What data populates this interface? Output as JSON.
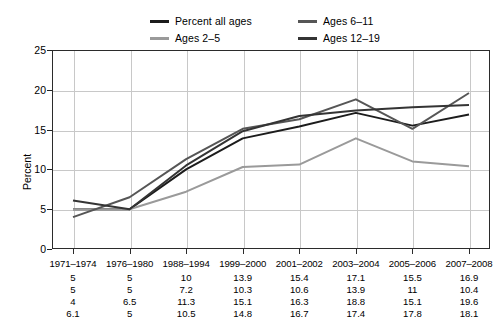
{
  "chart_data": {
    "type": "line",
    "title": "",
    "xlabel": "",
    "ylabel": "Percent",
    "ylim": [
      0,
      25
    ],
    "yticks": [
      0,
      5,
      10,
      15,
      20,
      25
    ],
    "grid": true,
    "legend_position": "top",
    "categories": [
      "1971–1974",
      "1976–1980",
      "1988–1994",
      "1999–2000",
      "2001–2002",
      "2003–2004",
      "2005–2006",
      "2007–2008"
    ],
    "series": [
      {
        "name": "Percent all ages",
        "color": "#1c1c1c",
        "values": [
          5,
          5,
          10,
          13.9,
          15.4,
          17.1,
          15.5,
          16.9
        ]
      },
      {
        "name": "Ages 2–5",
        "color": "#9a9a9a",
        "values": [
          5,
          5,
          7.2,
          10.3,
          10.6,
          13.9,
          11,
          10.4
        ]
      },
      {
        "name": "Ages 6–11",
        "color": "#565656",
        "values": [
          4,
          6.5,
          11.3,
          15.1,
          16.3,
          18.8,
          15.1,
          19.6
        ]
      },
      {
        "name": "Ages 12–19",
        "color": "#343434",
        "values": [
          6.1,
          5,
          10.5,
          14.8,
          16.7,
          17.4,
          17.8,
          18.1
        ]
      }
    ]
  },
  "legend": {
    "entries": [
      {
        "label": "Percent all ages",
        "color": "#1c1c1c"
      },
      {
        "label": "Ages 6–11",
        "color": "#565656"
      },
      {
        "label": "Ages 2–5",
        "color": "#9a9a9a"
      },
      {
        "label": "Ages 12–19",
        "color": "#343434"
      }
    ]
  },
  "axis": {
    "y_title": "Percent",
    "y_tick_labels": [
      "0",
      "5",
      "10",
      "15",
      "20",
      "25"
    ],
    "x_tick_labels": [
      "1971–1974",
      "1976–1980",
      "1988–1994",
      "1999–2000",
      "2001–2002",
      "2003–2004",
      "2005–2006",
      "2007–2008"
    ]
  },
  "data_table": {
    "rows": [
      {
        "series": "Percent all ages",
        "cells": [
          "5",
          "5",
          "10",
          "13.9",
          "15.4",
          "17.1",
          "15.5",
          "16.9"
        ]
      },
      {
        "series": "Ages 2–5",
        "cells": [
          "5",
          "5",
          "7.2",
          "10.3",
          "10.6",
          "13.9",
          "11",
          "10.4"
        ]
      },
      {
        "series": "Ages 6–11",
        "cells": [
          "4",
          "6.5",
          "11.3",
          "15.1",
          "16.3",
          "18.8",
          "15.1",
          "19.6"
        ]
      },
      {
        "series": "Ages 12–19",
        "cells": [
          "6.1",
          "5",
          "10.5",
          "14.8",
          "16.7",
          "17.4",
          "17.8",
          "18.1"
        ]
      }
    ]
  },
  "colors": {
    "grid": "#c8c8c8",
    "frame": "#2b2b2b",
    "background": "#ffffff",
    "text": "#000000"
  }
}
